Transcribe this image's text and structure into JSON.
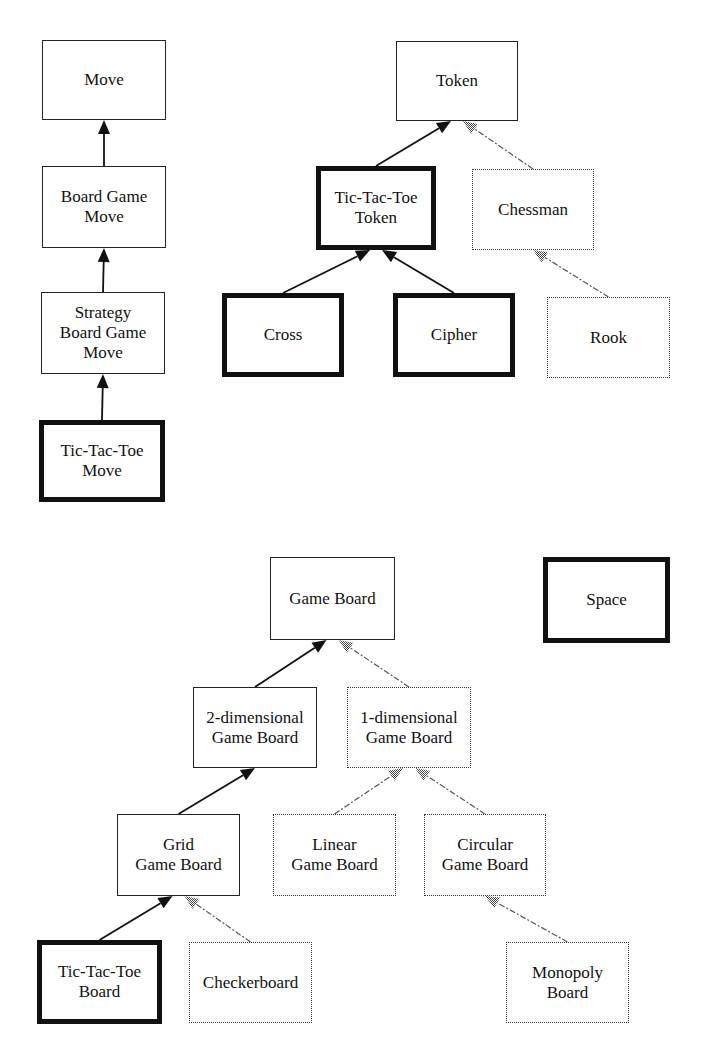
{
  "diagram": {
    "type": "class-hierarchy",
    "nodes": [
      {
        "id": "move",
        "label": "Move",
        "style": "normal",
        "x": 42,
        "y": 40,
        "w": 124,
        "h": 80
      },
      {
        "id": "board-game-move",
        "label": "Board Game\nMove",
        "style": "normal",
        "x": 42,
        "y": 166,
        "w": 124,
        "h": 82
      },
      {
        "id": "strategy-board-game-move",
        "label": "Strategy\nBoard Game\nMove",
        "style": "normal",
        "x": 41,
        "y": 292,
        "w": 124,
        "h": 82
      },
      {
        "id": "tic-tac-toe-move",
        "label": "Tic-Tac-Toe\nMove",
        "style": "bold",
        "x": 39,
        "y": 420,
        "w": 126,
        "h": 82
      },
      {
        "id": "token",
        "label": "Token",
        "style": "normal",
        "x": 396,
        "y": 41,
        "w": 122,
        "h": 80
      },
      {
        "id": "tic-tac-toe-token",
        "label": "Tic-Tac-Toe\nToken",
        "style": "bold",
        "x": 316,
        "y": 166,
        "w": 120,
        "h": 84
      },
      {
        "id": "chessman",
        "label": "Chessman",
        "style": "dotted",
        "x": 472,
        "y": 169,
        "w": 122,
        "h": 81
      },
      {
        "id": "cross",
        "label": "Cross",
        "style": "bold",
        "x": 222,
        "y": 293,
        "w": 122,
        "h": 84
      },
      {
        "id": "cipher",
        "label": "Cipher",
        "style": "bold",
        "x": 393,
        "y": 293,
        "w": 122,
        "h": 84
      },
      {
        "id": "rook",
        "label": "Rook",
        "style": "dotted",
        "x": 547,
        "y": 297,
        "w": 123,
        "h": 81
      },
      {
        "id": "game-board",
        "label": "Game Board",
        "style": "normal",
        "x": 270,
        "y": 557,
        "w": 125,
        "h": 83
      },
      {
        "id": "space",
        "label": "Space",
        "style": "bold",
        "x": 543,
        "y": 557,
        "w": 127,
        "h": 86
      },
      {
        "id": "2d-game-board",
        "label": "2-dimensional\nGame Board",
        "style": "normal",
        "x": 193,
        "y": 687,
        "w": 124,
        "h": 81
      },
      {
        "id": "1d-game-board",
        "label": "1-dimensional\nGame Board",
        "style": "dotted",
        "x": 347,
        "y": 687,
        "w": 124,
        "h": 81
      },
      {
        "id": "grid-game-board",
        "label": "Grid\nGame Board",
        "style": "normal",
        "x": 117,
        "y": 814,
        "w": 123,
        "h": 82
      },
      {
        "id": "linear-game-board",
        "label": "Linear\nGame Board",
        "style": "dotted",
        "x": 273,
        "y": 814,
        "w": 123,
        "h": 82
      },
      {
        "id": "circular-game-board",
        "label": "Circular\nGame Board",
        "style": "dotted",
        "x": 424,
        "y": 814,
        "w": 122,
        "h": 82
      },
      {
        "id": "tic-tac-toe-board",
        "label": "Tic-Tac-Toe\nBoard",
        "style": "bold",
        "x": 37,
        "y": 940,
        "w": 125,
        "h": 84
      },
      {
        "id": "checkerboard",
        "label": "Checkerboard",
        "style": "dotted",
        "x": 189,
        "y": 942,
        "w": 123,
        "h": 81
      },
      {
        "id": "monopoly-board",
        "label": "Monopoly\nBoard",
        "style": "dotted",
        "x": 506,
        "y": 942,
        "w": 123,
        "h": 81
      }
    ],
    "edges": [
      {
        "from": "board-game-move",
        "to": "move",
        "style": "solid"
      },
      {
        "from": "strategy-board-game-move",
        "to": "board-game-move",
        "style": "solid"
      },
      {
        "from": "tic-tac-toe-move",
        "to": "strategy-board-game-move",
        "style": "solid"
      },
      {
        "from": "tic-tac-toe-token",
        "to": "token",
        "style": "solid"
      },
      {
        "from": "chessman",
        "to": "token",
        "style": "dashed"
      },
      {
        "from": "cross",
        "to": "tic-tac-toe-token",
        "style": "solid"
      },
      {
        "from": "cipher",
        "to": "tic-tac-toe-token",
        "style": "solid"
      },
      {
        "from": "rook",
        "to": "chessman",
        "style": "dashed"
      },
      {
        "from": "2d-game-board",
        "to": "game-board",
        "style": "solid"
      },
      {
        "from": "1d-game-board",
        "to": "game-board",
        "style": "dashed"
      },
      {
        "from": "grid-game-board",
        "to": "2d-game-board",
        "style": "solid"
      },
      {
        "from": "linear-game-board",
        "to": "1d-game-board",
        "style": "dashed"
      },
      {
        "from": "circular-game-board",
        "to": "1d-game-board",
        "style": "dashed"
      },
      {
        "from": "tic-tac-toe-board",
        "to": "grid-game-board",
        "style": "solid"
      },
      {
        "from": "checkerboard",
        "to": "grid-game-board",
        "style": "dashed"
      },
      {
        "from": "monopoly-board",
        "to": "circular-game-board",
        "style": "dashed"
      }
    ],
    "colors": {
      "line": "#111111",
      "dashed": "#555555",
      "hatched_arrow": "#777777"
    }
  }
}
